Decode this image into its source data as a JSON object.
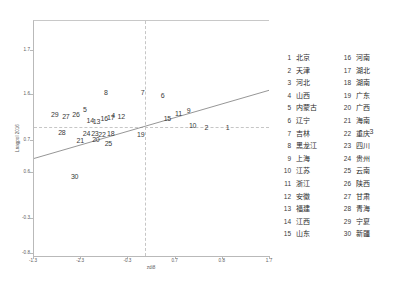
{
  "chart_data": {
    "type": "scatter",
    "title": "",
    "xlabel": "zdi8",
    "ylabel": "Lnagpol 2016",
    "xlim": [
      -1.3,
      1.7
    ],
    "ylim": [
      -0.8,
      1.7
    ],
    "xticks": [
      "-1.3",
      "-2.3",
      "-0.3",
      "0.7",
      "0.8",
      "1.7"
    ],
    "yticks": [
      "1.7",
      "1.6",
      "0.7",
      "0.6",
      "-0.3",
      "-0.8"
    ],
    "grid": true,
    "gridlines": {
      "vertical_at_x": 0.47,
      "horizontal_at_y": 0.55
    },
    "legend_position": "right",
    "fit_line": {
      "type": "linear",
      "x0": -1.3,
      "y0": 0.415,
      "x1": 1.7,
      "y1": 0.705
    },
    "point_label_field": "id",
    "points": [
      {
        "id": "1",
        "label": "北京",
        "x": 0.82,
        "y": 0.545
      },
      {
        "id": "2",
        "label": "天津",
        "x": 0.73,
        "y": 0.548
      },
      {
        "id": "3",
        "label": "河北",
        "x": 1.43,
        "y": 0.528
      },
      {
        "id": "4",
        "label": "山西",
        "x": 0.335,
        "y": 0.596
      },
      {
        "id": "5",
        "label": "内蒙古",
        "x": 0.215,
        "y": 0.625
      },
      {
        "id": "6",
        "label": "辽宁",
        "x": 0.545,
        "y": 0.682
      },
      {
        "id": "7",
        "label": "吉林",
        "x": 0.46,
        "y": 0.693
      },
      {
        "id": "8",
        "label": "黑龙江",
        "x": 0.305,
        "y": 0.697
      },
      {
        "id": "9",
        "label": "上海",
        "x": 0.655,
        "y": 0.617
      },
      {
        "id": "10",
        "label": "江苏",
        "x": 0.672,
        "y": 0.553
      },
      {
        "id": "11",
        "label": "浙江",
        "x": 0.612,
        "y": 0.607
      },
      {
        "id": "12",
        "label": "安徽",
        "x": 0.37,
        "y": 0.592
      },
      {
        "id": "13",
        "label": "福建",
        "x": 0.265,
        "y": 0.572
      },
      {
        "id": "14",
        "label": "江西",
        "x": 0.238,
        "y": 0.577
      },
      {
        "id": "15",
        "label": "山东",
        "x": 0.565,
        "y": 0.586
      },
      {
        "id": "16",
        "label": "河南",
        "x": 0.298,
        "y": 0.586
      },
      {
        "id": "17",
        "label": "湖北",
        "x": 0.325,
        "y": 0.589
      },
      {
        "id": "18",
        "label": "湖南",
        "x": 0.325,
        "y": 0.521
      },
      {
        "id": "19",
        "label": "广东",
        "x": 0.452,
        "y": 0.519
      },
      {
        "id": "20",
        "label": "广西",
        "x": 0.262,
        "y": 0.497
      },
      {
        "id": "21",
        "label": "海南",
        "x": 0.196,
        "y": 0.492
      },
      {
        "id": "22",
        "label": "重庆",
        "x": 0.288,
        "y": 0.519
      },
      {
        "id": "23",
        "label": "四川",
        "x": 0.258,
        "y": 0.523
      },
      {
        "id": "24",
        "label": "贵州",
        "x": 0.222,
        "y": 0.522
      },
      {
        "id": "25",
        "label": "云南",
        "x": 0.315,
        "y": 0.477
      },
      {
        "id": "26",
        "label": "陕西",
        "x": 0.178,
        "y": 0.601
      },
      {
        "id": "27",
        "label": "甘肃",
        "x": 0.135,
        "y": 0.594
      },
      {
        "id": "28",
        "label": "青海",
        "x": 0.118,
        "y": 0.525
      },
      {
        "id": "29",
        "label": "宁夏",
        "x": 0.088,
        "y": 0.602
      },
      {
        "id": "30",
        "label": "新疆",
        "x": 0.172,
        "y": 0.338
      }
    ]
  },
  "axes": {
    "x_title": "zdi8",
    "y_title": "Lnagpol 2016",
    "x_ticks": [
      {
        "label": "-1.3",
        "pos": 0.0
      },
      {
        "label": "-2.3",
        "pos": 0.2
      },
      {
        "label": "-0.3",
        "pos": 0.4
      },
      {
        "label": "0.7",
        "pos": 0.6
      },
      {
        "label": "0.8",
        "pos": 0.8
      },
      {
        "label": "1.7",
        "pos": 1.0
      }
    ],
    "y_ticks": [
      {
        "label": "1.7",
        "pos": 0.875
      },
      {
        "label": "1.6",
        "pos": 0.685
      },
      {
        "label": "0.7",
        "pos": 0.49
      },
      {
        "label": "0.6",
        "pos": 0.355
      },
      {
        "label": "-0.3",
        "pos": 0.16
      },
      {
        "label": "-0.8",
        "pos": 0.012
      }
    ]
  },
  "legend": {
    "columns": [
      [
        {
          "num": "1",
          "name": "北京"
        },
        {
          "num": "2",
          "name": "天津"
        },
        {
          "num": "3",
          "name": "河北"
        },
        {
          "num": "4",
          "name": "山西"
        },
        {
          "num": "5",
          "name": "内蒙古"
        },
        {
          "num": "6",
          "name": "辽宁"
        },
        {
          "num": "7",
          "name": "吉林"
        },
        {
          "num": "8",
          "name": "黑龙江"
        },
        {
          "num": "9",
          "name": "上海"
        },
        {
          "num": "10",
          "name": "江苏"
        },
        {
          "num": "11",
          "name": "浙江"
        },
        {
          "num": "12",
          "name": "安徽"
        },
        {
          "num": "13",
          "name": "福建"
        },
        {
          "num": "14",
          "name": "江西"
        },
        {
          "num": "15",
          "name": "山东"
        }
      ],
      [
        {
          "num": "16",
          "name": "河南"
        },
        {
          "num": "17",
          "name": "湖北"
        },
        {
          "num": "18",
          "name": "湖南"
        },
        {
          "num": "19",
          "name": "广东"
        },
        {
          "num": "20",
          "name": "广西"
        },
        {
          "num": "21",
          "name": "海南"
        },
        {
          "num": "22",
          "name": "重庆"
        },
        {
          "num": "23",
          "name": "四川"
        },
        {
          "num": "24",
          "name": "贵州"
        },
        {
          "num": "25",
          "name": "云南"
        },
        {
          "num": "26",
          "name": "陕西"
        },
        {
          "num": "27",
          "name": "甘肃"
        },
        {
          "num": "28",
          "name": "青海"
        },
        {
          "num": "29",
          "name": "宁夏"
        },
        {
          "num": "30",
          "name": "新疆"
        }
      ]
    ]
  },
  "colors": {
    "axis": "#b9b9b9",
    "grid": "#c6c6c6",
    "fit_line": "#7a7a7a",
    "label_text": "#3a3a3a",
    "background": "#ffffff"
  }
}
